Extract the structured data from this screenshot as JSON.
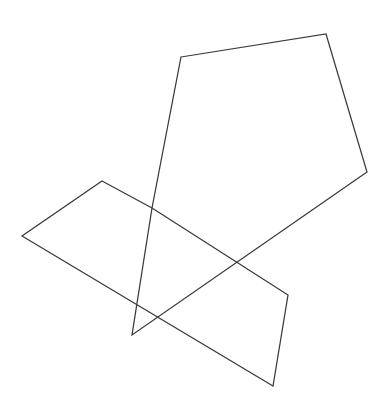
{
  "canvas": {
    "width": 387,
    "height": 417,
    "background_color": "#ffffff",
    "title": "Overlapping polygons line drawing"
  },
  "style": {
    "stroke_color": "#3a3a3a",
    "stroke_width": 1.25,
    "fill": "none"
  },
  "shapes": [
    {
      "name": "large-polygon",
      "type": "polygon",
      "sides": 5,
      "points": "181,57 326,34 367,172 132,335 152,208",
      "vertices": [
        {
          "x": 181,
          "y": 57
        },
        {
          "x": 326,
          "y": 34
        },
        {
          "x": 367,
          "y": 172
        },
        {
          "x": 132,
          "y": 335
        },
        {
          "x": 152,
          "y": 208
        }
      ]
    },
    {
      "name": "lower-zigzag-polygon",
      "type": "polygon",
      "sides": 5,
      "points": "102,181 152,208 238,263 288,295 273,386 22,236",
      "vertices": [
        {
          "x": 102,
          "y": 181
        },
        {
          "x": 152,
          "y": 208
        },
        {
          "x": 238,
          "y": 263
        },
        {
          "x": 288,
          "y": 295
        },
        {
          "x": 273,
          "y": 386
        },
        {
          "x": 22,
          "y": 236
        }
      ]
    }
  ],
  "intersections": [
    {
      "name": "crossing-upper",
      "x": 152,
      "y": 209
    },
    {
      "name": "crossing-lower",
      "x": 155,
      "y": 317
    }
  ]
}
